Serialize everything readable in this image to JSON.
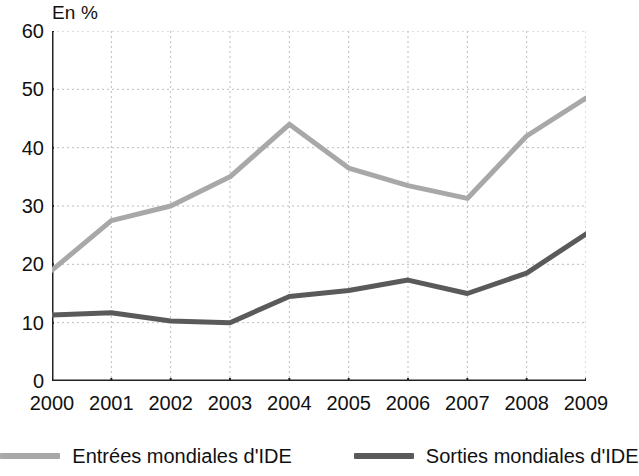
{
  "unit_label": "En %",
  "chart_data": {
    "type": "line",
    "title": "",
    "xlabel": "",
    "ylabel": "En %",
    "categories": [
      "2000",
      "2001",
      "2002",
      "2003",
      "2004",
      "2005",
      "2006",
      "2007",
      "2008",
      "2009"
    ],
    "ylim": [
      0,
      60
    ],
    "yticks": [
      0,
      10,
      20,
      30,
      40,
      50,
      60
    ],
    "grid": "dotted-both",
    "legend_position": "bottom",
    "series": [
      {
        "name": "Entrées mondiales d'IDE",
        "color": "#a8a8a8",
        "values": [
          19.0,
          27.5,
          30.0,
          35.0,
          44.0,
          36.5,
          33.5,
          31.3,
          42.0,
          48.5
        ]
      },
      {
        "name": "Sorties mondiales d'IDE",
        "color": "#5a5a5a",
        "values": [
          11.3,
          11.7,
          10.3,
          10.0,
          14.5,
          15.5,
          17.3,
          15.0,
          18.5,
          25.2
        ]
      }
    ]
  },
  "legend": {
    "items": [
      {
        "label": "Entrées mondiales d'IDE",
        "color": "#a8a8a8"
      },
      {
        "label": "Sorties mondiales d'IDE",
        "color": "#5a5a5a"
      }
    ]
  },
  "colors": {
    "axis": "#222222",
    "grid": "#bdbdbd",
    "entrees": "#a8a8a8",
    "sorties": "#5a5a5a",
    "text": "#111111",
    "background": "#ffffff"
  }
}
